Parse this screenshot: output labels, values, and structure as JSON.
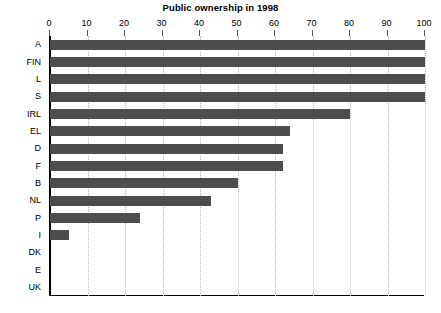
{
  "chart_data": {
    "type": "bar",
    "orientation": "horizontal",
    "title": "Public ownership in 1998",
    "xlabel": "",
    "ylabel": "",
    "categories": [
      "A",
      "FIN",
      "L",
      "S",
      "IRL",
      "EL",
      "D",
      "F",
      "B",
      "NL",
      "P",
      "I",
      "DK",
      "E",
      "UK"
    ],
    "values": [
      100,
      100,
      100,
      100,
      80,
      64,
      62,
      62,
      50,
      43,
      24,
      5,
      0,
      0,
      0
    ],
    "xlim": [
      0,
      100
    ],
    "xticks": [
      0,
      10,
      20,
      30,
      40,
      50,
      60,
      70,
      80,
      90,
      100
    ],
    "xtick_labels": [
      "0",
      "10",
      "20",
      "30",
      "40",
      "50",
      "60",
      "70",
      "80",
      "90",
      "100"
    ],
    "grid": true,
    "grid_axis": "x",
    "grid_style": "dotted",
    "legend": false,
    "bar_color": "#4d4d4d",
    "grid_color": "#b9b9bd",
    "axis_color": "#000000",
    "background": "#ffffff"
  }
}
